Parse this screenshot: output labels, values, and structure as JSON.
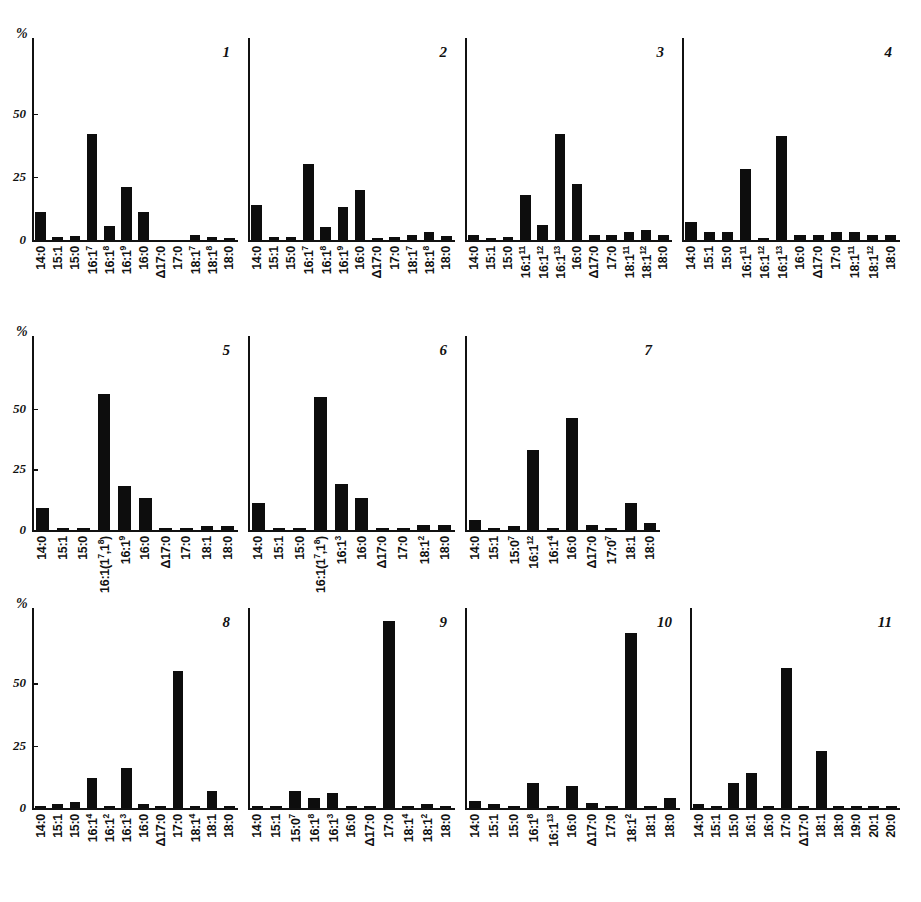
{
  "figure": {
    "axis_label": "%",
    "y_ticks": [
      "50",
      "25",
      "0"
    ],
    "y_tick_values": [
      50,
      25,
      0
    ],
    "ylim": [
      0,
      80
    ]
  },
  "chart_data": [
    {
      "type": "bar",
      "title": "1",
      "xlabel": "",
      "ylabel": "%",
      "ylim": [
        0,
        80
      ],
      "grid": false,
      "legend": "none",
      "categories": [
        "14:0",
        "15:1",
        "15:0",
        "16:1⁷",
        "16:1⁸",
        "16:1⁹",
        "16:0",
        "Δ17:0",
        "17:0",
        "18:1⁷",
        "18:1⁸",
        "18:0"
      ],
      "values": [
        11,
        1,
        1.5,
        42,
        5.5,
        21,
        11,
        0,
        0,
        2,
        1,
        0.5
      ]
    },
    {
      "type": "bar",
      "title": "2",
      "xlabel": "",
      "ylabel": "%",
      "ylim": [
        0,
        80
      ],
      "grid": false,
      "legend": "none",
      "categories": [
        "14:0",
        "15:1",
        "15:0",
        "16:1⁷",
        "16:1⁸",
        "16:1⁹",
        "16:0",
        "Δ17:0",
        "17:0",
        "18:1⁷",
        "18:1⁸",
        "18:0"
      ],
      "values": [
        14,
        1,
        1,
        30,
        5,
        13,
        20,
        0.5,
        1,
        2,
        3,
        1.5
      ]
    },
    {
      "type": "bar",
      "title": "3",
      "xlabel": "",
      "ylabel": "%",
      "ylim": [
        0,
        80
      ],
      "grid": false,
      "legend": "none",
      "categories": [
        "14:0",
        "15:1",
        "15:0",
        "16:1¹¹",
        "16:1¹²",
        "16:1¹³",
        "16:0",
        "Δ17:0",
        "17:0",
        "18:1¹¹",
        "18:1¹²",
        "18:0"
      ],
      "values": [
        2,
        0.5,
        1,
        18,
        6,
        42,
        22,
        2,
        2,
        3,
        4,
        2
      ]
    },
    {
      "type": "bar",
      "title": "4",
      "xlabel": "",
      "ylabel": "%",
      "ylim": [
        0,
        80
      ],
      "grid": false,
      "legend": "none",
      "categories": [
        "14:0",
        "15:1",
        "15:0",
        "16:1¹¹",
        "16:1¹²",
        "16:1¹³",
        "16:0",
        "Δ17:0",
        "17:0",
        "18:1¹¹",
        "18:1¹²",
        "18:0"
      ],
      "values": [
        7,
        3,
        3,
        28,
        0.5,
        41,
        2,
        2,
        3,
        3,
        2,
        2
      ]
    },
    {
      "type": "bar",
      "title": "5",
      "xlabel": "",
      "ylabel": "%",
      "ylim": [
        0,
        80
      ],
      "grid": false,
      "legend": "none",
      "categories": [
        "14:0",
        "15:1",
        "15:0",
        "16:1(1⁷,1⁸)",
        "16:1⁹",
        "16:0",
        "Δ17:0",
        "17:0",
        "18:1",
        "18:0"
      ],
      "values": [
        9,
        0.5,
        1,
        56,
        18,
        13,
        1,
        1,
        1.5,
        1.5
      ]
    },
    {
      "type": "bar",
      "title": "6",
      "xlabel": "",
      "ylabel": "%",
      "ylim": [
        0,
        80
      ],
      "grid": false,
      "legend": "none",
      "categories": [
        "14:0",
        "15:1",
        "15:0",
        "16:1(1⁷,1⁸)",
        "16:1³",
        "16:0",
        "Δ17:0",
        "17:0",
        "18:1²",
        "18:0"
      ],
      "values": [
        11,
        0.5,
        0.5,
        55,
        19,
        13,
        1,
        1,
        2,
        2
      ]
    },
    {
      "type": "bar",
      "title": "7",
      "xlabel": "",
      "ylabel": "%",
      "ylim": [
        0,
        80
      ],
      "grid": false,
      "legend": "none",
      "categories": [
        "14:0",
        "15:1",
        "15:0⁷",
        "16:1¹²",
        "16:1⁴",
        "16:0",
        "Δ17:0",
        "17:0⁷",
        "18:1",
        "18:0"
      ],
      "values": [
        4,
        0.5,
        1.5,
        33,
        0.5,
        46,
        2,
        1,
        11,
        3
      ]
    },
    {
      "type": "bar",
      "title": "8",
      "xlabel": "",
      "ylabel": "%",
      "ylim": [
        0,
        80
      ],
      "grid": false,
      "legend": "none",
      "categories": [
        "14:0",
        "15:1",
        "15:0",
        "16:1⁴",
        "16:1²",
        "16:1³",
        "16:0",
        "Δ17:0",
        "17:0",
        "18:1⁴",
        "18:1",
        "18:0"
      ],
      "values": [
        0.5,
        1.5,
        2.5,
        12,
        1,
        16,
        1.5,
        1,
        55,
        0.5,
        7,
        0.5
      ]
    },
    {
      "type": "bar",
      "title": "9",
      "xlabel": "",
      "ylabel": "%",
      "ylim": [
        0,
        80
      ],
      "grid": false,
      "legend": "none",
      "categories": [
        "14:0",
        "15:1",
        "15:0⁷",
        "16:1⁸",
        "16:1³",
        "16:0",
        "Δ17:0",
        "17:0",
        "18:1⁴",
        "18:1²",
        "18:0"
      ],
      "values": [
        0.5,
        1,
        7,
        4,
        6,
        0.5,
        0.5,
        75,
        1,
        1.5,
        0.5
      ]
    },
    {
      "type": "bar",
      "title": "10",
      "xlabel": "",
      "ylabel": "%",
      "ylim": [
        0,
        80
      ],
      "grid": false,
      "legend": "none",
      "categories": [
        "14:0",
        "15:1",
        "15:0",
        "16:1⁸",
        "16:1¹³",
        "16:0",
        "Δ17:0",
        "17:0",
        "18:1²",
        "18:1",
        "18:0"
      ],
      "values": [
        3,
        1.5,
        1,
        10,
        0.5,
        9,
        2,
        1,
        70,
        0.5,
        4
      ]
    },
    {
      "type": "bar",
      "title": "11",
      "xlabel": "",
      "ylabel": "%",
      "ylim": [
        0,
        80
      ],
      "grid": false,
      "legend": "none",
      "categories": [
        "14:0",
        "15:1",
        "15:0",
        "16:1",
        "16:0",
        "17:0",
        "Δ17:0",
        "18:1",
        "18:0",
        "19:0",
        "20:1",
        "20:0"
      ],
      "values": [
        1.5,
        0.5,
        10,
        14,
        0.5,
        56,
        0.5,
        23,
        0.5,
        0.5,
        0.5,
        0.5
      ]
    }
  ],
  "layout": {
    "rows": [
      {
        "panels": [
          0,
          1,
          2,
          3
        ]
      },
      {
        "panels": [
          4,
          5,
          6
        ]
      },
      {
        "panels": [
          7,
          8,
          9,
          10
        ]
      }
    ]
  }
}
